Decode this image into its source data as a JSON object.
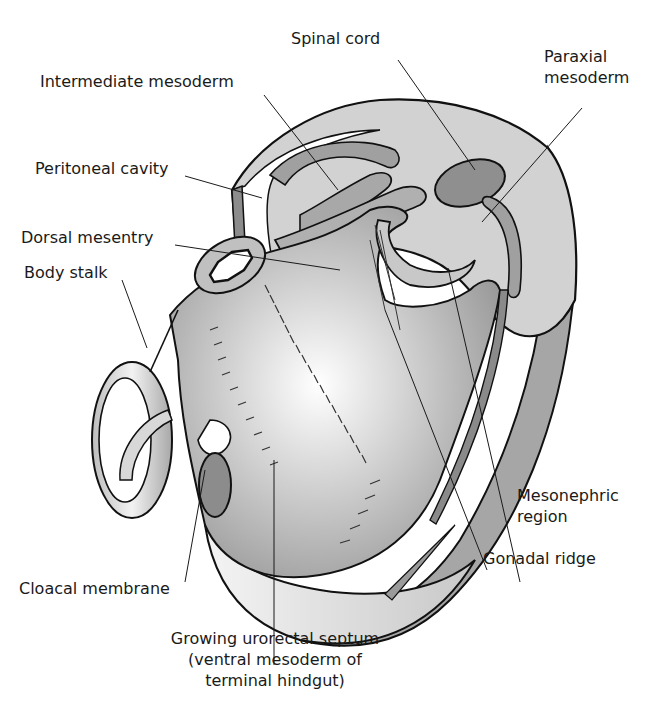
{
  "diagram": {
    "colors": {
      "outline": "#111111",
      "light_gray": "#d4d4d4",
      "mid_gray": "#a9a9a9",
      "dark_gray": "#8a8a8a",
      "white": "#ffffff"
    },
    "labels": [
      {
        "id": "spinal-cord",
        "text": "Spinal cord"
      },
      {
        "id": "intermediate-mesoderm",
        "text": "Intermediate mesoderm"
      },
      {
        "id": "paraxial-mesoderm",
        "lines": [
          "Paraxial",
          "mesoderm"
        ]
      },
      {
        "id": "peritoneal-cavity",
        "text": "Peritoneal cavity"
      },
      {
        "id": "dorsal-mesentry",
        "text": "Dorsal mesentry"
      },
      {
        "id": "body-stalk",
        "text": "Body stalk"
      },
      {
        "id": "mesonephric-region",
        "lines": [
          "Mesonephric",
          "region"
        ]
      },
      {
        "id": "gonadal-ridge",
        "text": "Gonadal ridge"
      },
      {
        "id": "cloacal-membrane",
        "text": "Cloacal membrane"
      },
      {
        "id": "urorectal-septum",
        "lines": [
          "Growing urorectal septum",
          "(ventral mesoderm of",
          "terminal hindgut)"
        ]
      }
    ]
  }
}
